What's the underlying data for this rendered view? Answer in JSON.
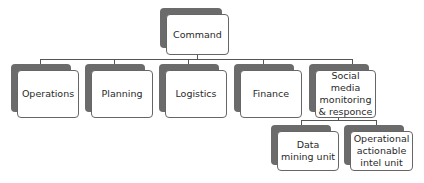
{
  "diagram": {
    "type": "org-chart",
    "root": {
      "label": "Command"
    },
    "level1": [
      {
        "label": "Operations"
      },
      {
        "label": "Planning"
      },
      {
        "label": "Logistics"
      },
      {
        "label": "Finance"
      },
      {
        "label": "Social media monitoring & responce"
      }
    ],
    "level2": [
      {
        "parent": "Social media monitoring & responce",
        "label": "Data mining unit"
      },
      {
        "parent": "Social media monitoring & responce",
        "label": "Operational actionable intel unit"
      }
    ]
  },
  "colors": {
    "shadow": "#6b6b6b",
    "box": "#ffffff",
    "border": "#666666",
    "line": "#555555"
  }
}
